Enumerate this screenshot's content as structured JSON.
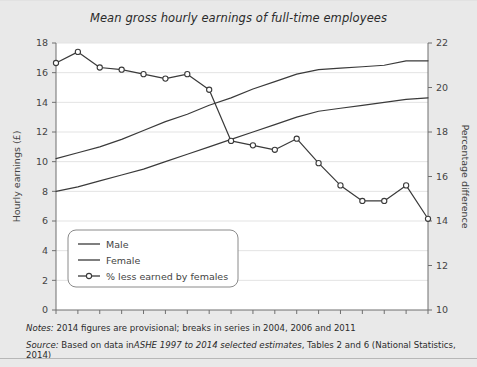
{
  "chart_data": {
    "type": "line",
    "title": "Mean gross hourly earnings of full-time employees",
    "xlabel": "",
    "ylabel": "Hourly earnings (£)",
    "y2label": "Percentage difference",
    "x": [
      1997,
      1998,
      1999,
      2000,
      2001,
      2002,
      2003,
      2004,
      2005,
      2006,
      2007,
      2008,
      2009,
      2010,
      2011,
      2012,
      2013,
      2014
    ],
    "xticklabels": [
      "1997",
      "1999",
      "2001",
      "2003",
      "2005",
      "2007",
      "2009",
      "2011",
      "2013"
    ],
    "xlim": [
      1997,
      2014
    ],
    "ylim": [
      0,
      18
    ],
    "yticks": [
      0,
      2,
      4,
      6,
      8,
      10,
      12,
      14,
      16,
      18
    ],
    "y2lim": [
      10,
      22
    ],
    "y2ticks": [
      10,
      12,
      14,
      16,
      18,
      20,
      22
    ],
    "grid": "horizontal",
    "legend_position": "lower-left-inside",
    "series": [
      {
        "name": "Male",
        "axis": "left",
        "marker": "none",
        "color": "#3a3a3a",
        "values": [
          10.2,
          10.6,
          11.0,
          11.5,
          12.1,
          12.7,
          13.2,
          13.8,
          14.3,
          14.9,
          15.4,
          15.9,
          16.2,
          16.3,
          16.4,
          16.5,
          16.8,
          16.8
        ]
      },
      {
        "name": "Female",
        "axis": "left",
        "marker": "none",
        "color": "#3a3a3a",
        "values": [
          8.0,
          8.3,
          8.7,
          9.1,
          9.5,
          10.0,
          10.5,
          11.0,
          11.5,
          12.0,
          12.5,
          13.0,
          13.4,
          13.6,
          13.8,
          14.0,
          14.2,
          14.3
        ]
      },
      {
        "name": "% less earned by females",
        "axis": "right",
        "marker": "open-circle",
        "color": "#3a3a3a",
        "values": [
          21.1,
          21.6,
          20.9,
          20.8,
          20.6,
          20.4,
          20.6,
          19.9,
          17.6,
          17.4,
          17.2,
          17.7,
          16.6,
          15.6,
          14.9,
          14.9,
          15.6,
          14.1
        ]
      }
    ],
    "left_axis_equivalent_values": [
      16.6,
      17.3,
      16.3,
      16.2,
      15.9,
      15.6,
      15.9,
      14.8,
      11.4,
      11.1,
      10.8,
      11.6,
      9.9,
      8.4,
      7.3,
      7.3,
      8.4,
      6.1
    ]
  },
  "legend": {
    "items": [
      {
        "label": "Male"
      },
      {
        "label": "Female"
      },
      {
        "label": "% less earned by females"
      }
    ]
  },
  "footer": {
    "notes_label": "Notes:",
    "notes_text": "2014 figures are provisional; breaks in series in 2004, 2006 and 2011",
    "source_label": "Source:",
    "source_prefix": "Based on data in",
    "source_italic": "ASHE 1997 to 2014 selected estimates",
    "source_suffix": ", Tables 2 and 6 (National Statistics, 2014)"
  }
}
